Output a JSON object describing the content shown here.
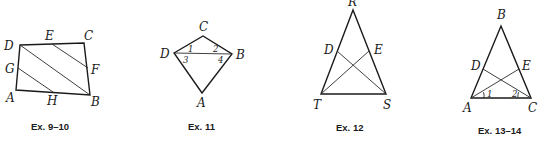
{
  "figures": [
    {
      "caption": "Ex. 9–10",
      "labels": {
        "D": "D",
        "E": "E",
        "C": "C",
        "G": "G",
        "F": "F",
        "A": "A",
        "H": "H",
        "B": "B"
      }
    },
    {
      "caption": "Ex. 11",
      "labels": {
        "C": "C",
        "D": "D",
        "B": "B",
        "A": "A"
      },
      "angles": {
        "a1": "1",
        "a2": "2",
        "a3": "3",
        "a4": "4"
      }
    },
    {
      "caption": "Ex. 12",
      "labels": {
        "R": "R",
        "D": "D",
        "E": "E",
        "T": "T",
        "S": "S"
      }
    },
    {
      "caption": "Ex. 13–14",
      "labels": {
        "B": "B",
        "D": "D",
        "E": "E",
        "A": "A",
        "C": "C"
      },
      "angles": {
        "a1": "1",
        "a2": "2"
      }
    }
  ]
}
